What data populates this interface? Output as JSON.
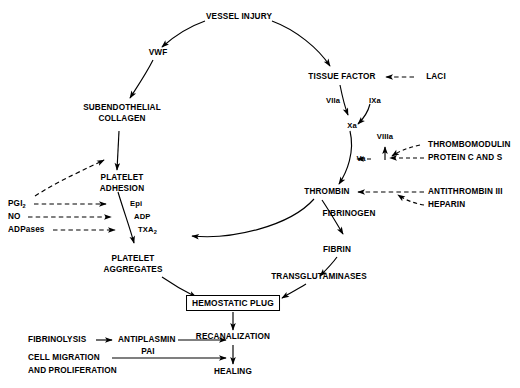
{
  "diagram": {
    "background_color": "#ffffff",
    "stroke_color": "#000000",
    "width": 520,
    "height": 388
  },
  "nodes": {
    "vessel_injury": "VESSEL INJURY",
    "vwf": "VWF",
    "tissue_factor": "TISSUE FACTOR",
    "laci": "LACI",
    "viia": "VIIa",
    "ixa": "IXa",
    "xa": "Xa",
    "viiia": "VIIIa",
    "va": "Va",
    "thrombomodulin": "THROMBOMODULIN",
    "protein_c_and_s": "PROTEIN C AND S",
    "thrombin": "THROMBIN",
    "antithrombin_iii": "ANTITHROMBIN III",
    "heparin": "HEPARIN",
    "fibrinogen": "FIBRINOGEN",
    "fibrin": "FIBRIN",
    "transglutaminases": "TRANSGLUTAMINASES",
    "subendothelial_line1": "SUBENDOTHELIAL",
    "subendothelial_line2": "COLLAGEN",
    "platelet_adhesion_line1": "PLATELET",
    "platelet_adhesion_line2": "ADHESION",
    "platelet_aggregates_line1": "PLATELET",
    "platelet_aggregates_line2": "AGGREGATES",
    "epi": "Epi",
    "adp": "ADP",
    "txa2": "TXA",
    "txa2_sub": "2",
    "pgi2": "PGI",
    "pgi2_sub": "2",
    "no": "NO",
    "adpases": "ADPases",
    "hemostatic_plug": "HEMOSTATIC PLUG",
    "recanalization": "RECANALIZATION",
    "healing": "HEALING",
    "fibrinolysis": "FIBRINOLYSIS",
    "antiplasmin": "ANTIPLASMIN",
    "pai": "PAI",
    "cell_migration_line1": "CELL MIGRATION",
    "cell_migration_line2": "AND PROLIFERATION"
  },
  "edges": [
    {
      "from": "VESSEL INJURY",
      "to": "VWF",
      "style": "solid"
    },
    {
      "from": "VESSEL INJURY",
      "to": "TISSUE FACTOR",
      "style": "solid"
    },
    {
      "from": "VWF",
      "to": "SUBENDOTHELIAL COLLAGEN",
      "style": "solid"
    },
    {
      "from": "SUBENDOTHELIAL COLLAGEN",
      "to": "PLATELET ADHESION",
      "style": "solid"
    },
    {
      "from": "PLATELET ADHESION",
      "to": "PLATELET AGGREGATES",
      "style": "solid"
    },
    {
      "from": "PGI2",
      "to": "PLATELET ADHESION",
      "style": "dashed",
      "meaning": "inhibition"
    },
    {
      "from": "PGI2",
      "to": "SUBENDOTHELIAL COLLAGEN",
      "style": "dashed",
      "meaning": "inhibition"
    },
    {
      "from": "NO",
      "to": "PLATELET ADHESION",
      "style": "dashed",
      "meaning": "inhibition"
    },
    {
      "from": "ADPases",
      "to": "PLATELET ADHESION",
      "style": "dashed",
      "meaning": "inhibition"
    },
    {
      "from": "LACI",
      "to": "TISSUE FACTOR",
      "style": "dashed",
      "meaning": "inhibition"
    },
    {
      "from": "TISSUE FACTOR",
      "to": "Xa",
      "style": "solid",
      "label": "VIIa"
    },
    {
      "from": "IXa",
      "to": "Xa",
      "style": "solid"
    },
    {
      "from": "Xa",
      "to": "THROMBIN",
      "style": "solid",
      "label": "Va"
    },
    {
      "from": "THROMBOMODULIN",
      "to": "Va",
      "style": "dashed",
      "meaning": "inhibition"
    },
    {
      "from": "PROTEIN C AND S",
      "to": "Va",
      "style": "dashed",
      "meaning": "inhibition"
    },
    {
      "from": "PROTEIN C AND S",
      "to": "VIIIa",
      "style": "dashed",
      "meaning": "inhibition"
    },
    {
      "from": "ANTITHROMBIN III",
      "to": "THROMBIN",
      "style": "dashed",
      "meaning": "inhibition"
    },
    {
      "from": "HEPARIN",
      "to": "THROMBIN",
      "style": "dashed",
      "meaning": "inhibition"
    },
    {
      "from": "THROMBIN",
      "to": "FIBRIN",
      "style": "solid",
      "label": "FIBRINOGEN"
    },
    {
      "from": "THROMBIN",
      "to": "PLATELET AGGREGATES",
      "style": "solid"
    },
    {
      "from": "FIBRIN",
      "to": "TRANSGLUTAMINASES",
      "style": "solid"
    },
    {
      "from": "PLATELET AGGREGATES",
      "to": "HEMOSTATIC PLUG",
      "style": "solid"
    },
    {
      "from": "TRANSGLUTAMINASES",
      "to": "HEMOSTATIC PLUG",
      "style": "solid"
    },
    {
      "from": "HEMOSTATIC PLUG",
      "to": "RECANALIZATION",
      "style": "solid"
    },
    {
      "from": "RECANALIZATION",
      "to": "HEALING",
      "style": "solid"
    },
    {
      "from": "FIBRINOLYSIS",
      "to": "ANTIPLASMIN",
      "style": "solid"
    },
    {
      "from": "ANTIPLASMIN / PAI",
      "to": "RECANALIZATION",
      "style": "solid"
    },
    {
      "from": "CELL MIGRATION AND PROLIFERATION",
      "to": "HEALING",
      "style": "solid"
    }
  ]
}
